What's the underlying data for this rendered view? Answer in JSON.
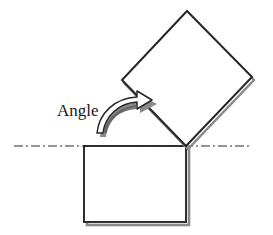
{
  "figure": {
    "background_color": "#ffffff",
    "stroke_color": "#262626",
    "shadow_color": "#8a8a8a",
    "arrow_fill_color": "#ffffff",
    "baseline_color": "#2b2b2b",
    "labels": {
      "angle": "Angle"
    },
    "geometry": {
      "pivot": {
        "x": 186,
        "y": 146
      },
      "baseline": {
        "x_start": 14,
        "x_end": 252,
        "y": 146,
        "style": "dash-dot"
      },
      "base_square": {
        "name": "base-square",
        "x": 84,
        "y": 146,
        "width": 102,
        "height": 76,
        "rotation_deg": 0
      },
      "rotated_square": {
        "name": "rotated-square",
        "rotation_deg": 45,
        "vertices": [
          {
            "x": 186,
            "y": 146
          },
          {
            "x": 122,
            "y": 80
          },
          {
            "x": 187,
            "y": 11
          },
          {
            "x": 252,
            "y": 77
          }
        ]
      },
      "angle_arrow": {
        "name": "rotation-arrow",
        "direction": "counterclockwise-to-clockwise-curve",
        "tip": {
          "x": 152,
          "y": 101
        },
        "tail": {
          "x": 104,
          "y": 133
        }
      },
      "angle_label_position": {
        "x": 57,
        "y": 116
      }
    }
  }
}
